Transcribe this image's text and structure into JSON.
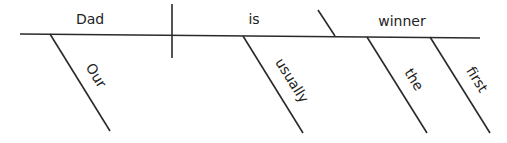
{
  "diagram": {
    "type": "sentence-diagram",
    "sentence": "Our Dad is usually the first winner",
    "subject": {
      "word": "Dad",
      "x": 90,
      "y": 24
    },
    "verb": {
      "word": "is",
      "x": 254,
      "y": 24
    },
    "predicate_nominative": {
      "word": "winner",
      "x": 402,
      "y": 26
    },
    "modifiers": [
      {
        "word": "Our",
        "modifies": "Dad",
        "x1": 50,
        "y1": 34,
        "x2": 110,
        "y2": 131,
        "tx": 88,
        "ty": 80
      },
      {
        "word": "usually",
        "modifies": "is",
        "x1": 243,
        "y1": 36,
        "x2": 303,
        "y2": 133,
        "tx": 290,
        "ty": 86
      },
      {
        "word": "the",
        "modifies": "winner",
        "x1": 367,
        "y1": 37,
        "x2": 427,
        "y2": 133,
        "tx": 408,
        "ty": 84
      },
      {
        "word": "first",
        "modifies": "winner",
        "x1": 430,
        "y1": 37,
        "x2": 490,
        "y2": 133,
        "tx": 471,
        "ty": 84
      }
    ],
    "baseline": {
      "x1": 20,
      "y1": 34,
      "x2": 480,
      "y2": 38
    },
    "subject_verb_divider": {
      "x1": 172,
      "y1": 4,
      "x2": 172,
      "y2": 58
    },
    "verb_complement_divider": {
      "x1": 318,
      "y1": 10,
      "x2": 335,
      "y2": 36
    },
    "line_color": "#2a2a2a",
    "text_color": "#222222"
  }
}
